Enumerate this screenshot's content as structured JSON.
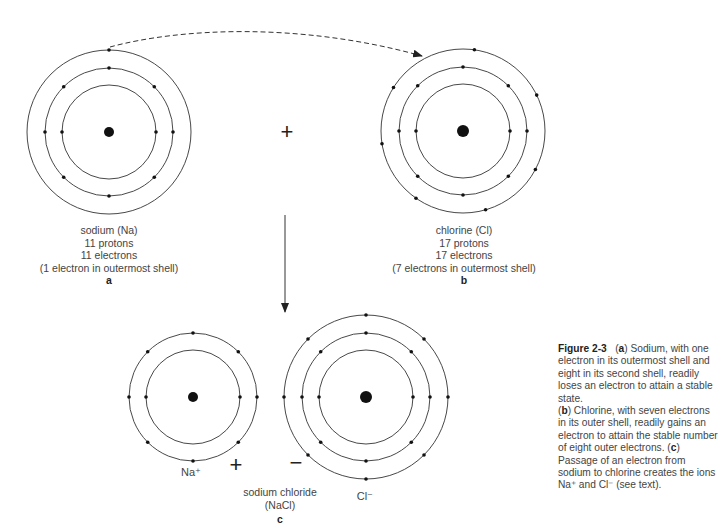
{
  "figure": {
    "number": "Figure 2-3",
    "caption_parts": [
      {
        "text": "(",
        "bold": false
      },
      {
        "text": "a",
        "bold": true
      },
      {
        "text": ") Sodium, with one electron in its outermost shell and eight in its second shell, readily loses an electron to attain a stable state.",
        "bold": false
      },
      {
        "break": true
      },
      {
        "text": "(",
        "bold": false
      },
      {
        "text": "b",
        "bold": true
      },
      {
        "text": ") Chlorine, with seven electrons in its outer shell, readily gains an electron to attain the stable number of eight outer electrons. (",
        "bold": false
      },
      {
        "text": "c",
        "bold": true
      },
      {
        "text": ") Passage of an electron from sodium to chlorine creates the ions Na⁺ and Cl⁻ (see text).",
        "bold": false
      }
    ]
  },
  "atoms": {
    "sodium": {
      "name": "sodium (Na)",
      "protons": "11 protons",
      "electrons": "11 electrons",
      "note": "(1 electron in outermost shell)",
      "panel": "a",
      "shells": [
        2,
        8,
        1
      ]
    },
    "chlorine": {
      "name": "chlorine (Cl)",
      "protons": "17 protons",
      "electrons": "17 electrons",
      "note": "(7 electrons in outermost shell)",
      "panel": "b",
      "shells": [
        2,
        8,
        7
      ]
    },
    "sodium_ion": {
      "symbol": "Na⁺",
      "shells": [
        2,
        8
      ],
      "charge": "+"
    },
    "chloride_ion": {
      "symbol": "Cl⁻",
      "shells": [
        2,
        8,
        8
      ],
      "charge": "−"
    }
  },
  "compound": {
    "name": "sodium chloride",
    "formula": "(NaCl)",
    "panel": "c"
  },
  "reaction": {
    "plus_sign": "+",
    "arrow": "electron transfer (dashed)",
    "yield_arrow": "down"
  }
}
